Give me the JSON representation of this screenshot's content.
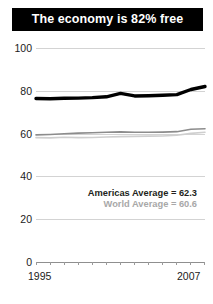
{
  "title": {
    "text": "The economy is 82% free"
  },
  "legend": {
    "americas": "Americas Average = 62.3",
    "world": "World Average = 60.6"
  },
  "axis": {
    "y_ticks": [
      "100",
      "80",
      "60",
      "40",
      "20",
      "0"
    ],
    "x_start_label": "1995",
    "x_end_label": "2007"
  },
  "colors": {
    "banner_bg": "#000000",
    "banner_text": "#ffffff",
    "country_line": "#000000",
    "americas_line": "#8c8c8c",
    "world_line": "#cfcfcf",
    "gridline": "#d3d3d3",
    "baseline": "#8f8f8f",
    "tick_text": "#1b1b1b"
  },
  "chart_data": {
    "type": "line",
    "title": "The economy is 82% free",
    "xlabel": "",
    "ylabel": "",
    "ylim": [
      0,
      100
    ],
    "xlim": [
      1995,
      2007
    ],
    "grid": true,
    "legend_position": "inside-right",
    "yticks": [
      0,
      20,
      40,
      60,
      80,
      100
    ],
    "xticks": [
      1995,
      1996,
      1997,
      1998,
      1999,
      2000,
      2001,
      2002,
      2003,
      2004,
      2005,
      2006,
      2007
    ],
    "x": [
      1995,
      1996,
      1997,
      1998,
      1999,
      2000,
      2001,
      2002,
      2003,
      2004,
      2005,
      2006,
      2007
    ],
    "series": [
      {
        "name": "Country",
        "style": "thick-black",
        "color": "#000000",
        "values": [
          76.4,
          76.3,
          76.5,
          76.6,
          76.8,
          77.2,
          78.8,
          77.6,
          77.7,
          77.9,
          78.2,
          80.6,
          82.0
        ]
      },
      {
        "name": "Americas Average",
        "style": "thin-gray",
        "color": "#8c8c8c",
        "label_value": 62.3,
        "values": [
          59.4,
          59.6,
          59.9,
          60.2,
          60.4,
          60.6,
          60.8,
          60.6,
          60.6,
          60.7,
          60.9,
          62.0,
          62.3
        ]
      },
      {
        "name": "World Average",
        "style": "thin-lightgray",
        "color": "#cfcfcf",
        "label_value": 60.6,
        "values": [
          58.1,
          58.0,
          58.3,
          58.1,
          58.2,
          58.4,
          58.6,
          58.7,
          58.8,
          58.9,
          59.2,
          60.1,
          60.6
        ]
      }
    ]
  }
}
